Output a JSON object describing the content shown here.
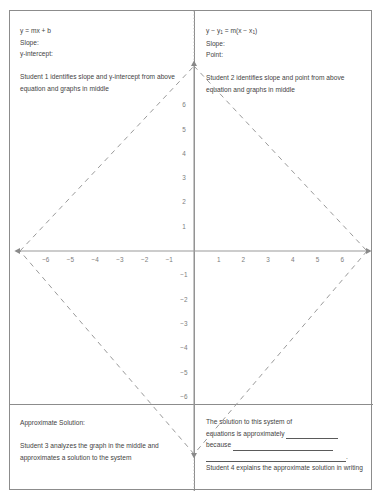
{
  "worksheet": {
    "title": "Systems of Equations Four Student Worksheet",
    "border_color": "#8c8c8c"
  },
  "quadrants": {
    "top_left": {
      "equation": "y = mx + b",
      "field_1": "Slope:",
      "field_2": "y-intercept:",
      "instruction": "Student 1 identifies slope and y-intercept from above equation and graphs in middle"
    },
    "top_right": {
      "equation_pre": "y − y",
      "equation_sub1": "1",
      "equation_mid": " = m(x − x",
      "equation_sub2": "1",
      "equation_post": ")",
      "equation_plain": "y − y1 = m(x − x1)",
      "field_1": "Slope:",
      "field_2": "Point:",
      "instruction": "Student 2 identifies slope and point from above equation and graphs in middle"
    },
    "bottom_left": {
      "field_1": "Approximate Solution:",
      "instruction": "Student 3 analyzes the graph in the middle and approximates a solution to the system"
    },
    "bottom_right": {
      "prompt_line_1": "The solution to this system of",
      "prompt_line_2": "equations is approximately",
      "prompt_line_3": "because",
      "instruction": "Student 4 explains the approximate solution in writing"
    }
  },
  "chart_data": {
    "type": "line",
    "title": "",
    "xlabel": "",
    "ylabel": "",
    "xlim": [
      -7,
      7
    ],
    "ylim": [
      -7,
      7
    ],
    "grid": false,
    "legend": null,
    "x_tick_labels": [
      "−6",
      "−5",
      "−4",
      "−3",
      "−2",
      "−1",
      "1",
      "2",
      "3",
      "4",
      "5",
      "6"
    ],
    "x_tick_values": [
      -6,
      -5,
      -4,
      -3,
      -2,
      -1,
      1,
      2,
      3,
      4,
      5,
      6
    ],
    "y_tick_labels": [
      "6",
      "5",
      "4",
      "3",
      "2",
      "1",
      "−1",
      "−2",
      "−3",
      "−4",
      "−5",
      "−6"
    ],
    "y_tick_values": [
      6,
      5,
      4,
      3,
      2,
      1,
      -1,
      -2,
      -3,
      -4,
      -5,
      -6
    ],
    "axis_color": "#9a9a9a",
    "dash_color": "#9a9a9a",
    "series": [
      {
        "name": "diamond-edge-upper-left",
        "style": "dashed",
        "x": [
          -7.3,
          0
        ],
        "y": [
          0,
          7.2
        ]
      },
      {
        "name": "diamond-edge-upper-right",
        "style": "dashed",
        "x": [
          0,
          7.3
        ],
        "y": [
          7.2,
          0
        ]
      },
      {
        "name": "diamond-edge-lower-right",
        "style": "dashed",
        "x": [
          7.3,
          0
        ],
        "y": [
          0,
          -8.4
        ]
      },
      {
        "name": "diamond-edge-lower-left",
        "style": "dashed",
        "x": [
          0,
          -7.3
        ],
        "y": [
          -8.4,
          0
        ]
      }
    ]
  }
}
